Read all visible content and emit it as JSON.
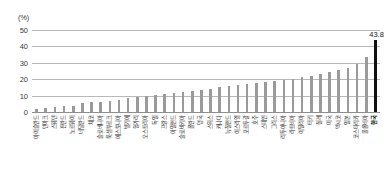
{
  "chart": {
    "unit_caption": "(%)",
    "value_annotation": "43.8"
  },
  "chart_data": {
    "type": "bar",
    "title": "",
    "subtitle": "",
    "xlabel": "",
    "ylabel": "(%)",
    "ylim": [
      0,
      50
    ],
    "yticks": [
      0,
      10,
      20,
      30,
      40,
      50
    ],
    "ytick_labels": [
      "0",
      "10",
      "20",
      "30",
      "40",
      "50"
    ],
    "grid": true,
    "legend": "none",
    "highlight_category": "한국",
    "highlight_color": "#111111",
    "bar_color": "#9a9a9a",
    "data_labels": {
      "한국": "43.8"
    },
    "categories": [
      "아이슬란드",
      "덴마크",
      "스웨덴",
      "핀란드",
      "노르웨이",
      "네덜란드",
      "체코",
      "슬로베니아",
      "룩셈부르크",
      "에스토니아",
      "벨기에",
      "헝가리",
      "오스트리아",
      "독일",
      "프랑스",
      "아일랜드",
      "슬로바키아",
      "폴란드",
      "영국",
      "스위스",
      "캐나다",
      "뉴질랜드",
      "이스라엘",
      "포르투갈",
      "호주",
      "스페인",
      "그리스",
      "리투아니아",
      "라트비아",
      "이탈리아",
      "터키",
      "칠레",
      "미국",
      "멕시코",
      "일본",
      "코스타리카",
      "콜롬비아",
      "한국"
    ],
    "values": [
      2.0,
      2.4,
      3.0,
      3.4,
      3.8,
      5.6,
      6.0,
      6.4,
      7.0,
      7.6,
      8.4,
      9.0,
      9.6,
      10.2,
      11.0,
      11.6,
      12.2,
      13.0,
      13.6,
      14.2,
      15.0,
      15.6,
      16.2,
      17.0,
      17.6,
      18.4,
      19.0,
      19.6,
      20.4,
      21.2,
      22.0,
      23.0,
      24.4,
      25.6,
      27.0,
      29.0,
      33.4,
      43.8
    ]
  }
}
